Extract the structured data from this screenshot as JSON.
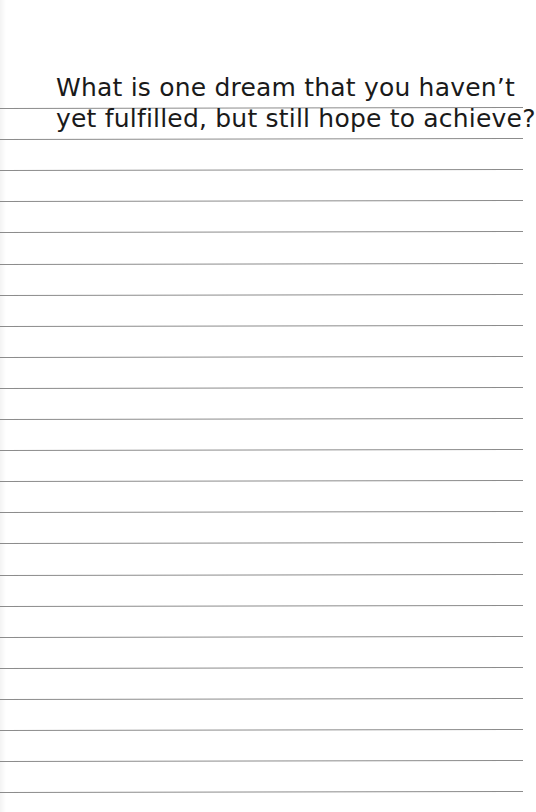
{
  "journal_page": {
    "prompt": {
      "line_1": "What is one dream that you haven’t",
      "line_2": "yet fulfilled, but still hope to achieve?"
    },
    "ruled_lines": {
      "count": 23,
      "first_y": 108,
      "spacing": 31.1,
      "color": "#8c8c8c"
    },
    "colors": {
      "background": "#ffffff",
      "text": "#1a1a1a"
    }
  }
}
